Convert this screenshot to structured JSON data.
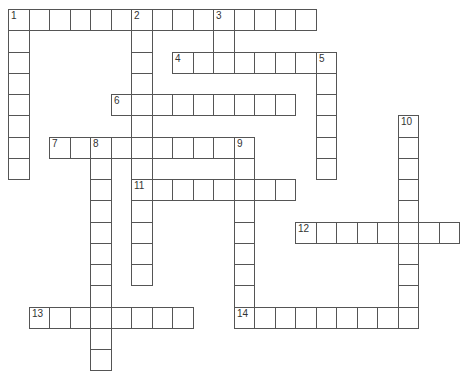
{
  "puzzle": {
    "grid": {
      "origin_x": 8,
      "origin_y": 9,
      "cell_w": 20.5,
      "cell_h": 21.25,
      "line_color": "#555555",
      "number_color": "#333333"
    },
    "entries": [
      {
        "number": "1",
        "direction": "across",
        "row": 0,
        "col": 0,
        "length": 15
      },
      {
        "number": "1",
        "direction": "down",
        "row": 0,
        "col": 0,
        "length": 8
      },
      {
        "number": "2",
        "direction": "down",
        "row": 0,
        "col": 6,
        "length": 13
      },
      {
        "number": "3",
        "direction": "down",
        "row": 0,
        "col": 10,
        "length": 3
      },
      {
        "number": "4",
        "direction": "across",
        "row": 2,
        "col": 8,
        "length": 8
      },
      {
        "number": "5",
        "direction": "down",
        "row": 2,
        "col": 15,
        "length": 6
      },
      {
        "number": "6",
        "direction": "across",
        "row": 4,
        "col": 5,
        "length": 9
      },
      {
        "number": "7",
        "direction": "across",
        "row": 6,
        "col": 2,
        "length": 10
      },
      {
        "number": "8",
        "direction": "down",
        "row": 6,
        "col": 4,
        "length": 11
      },
      {
        "number": "9",
        "direction": "down",
        "row": 6,
        "col": 11,
        "length": 9
      },
      {
        "number": "10",
        "direction": "down",
        "row": 5,
        "col": 19,
        "length": 10
      },
      {
        "number": "11",
        "direction": "across",
        "row": 8,
        "col": 6,
        "length": 8
      },
      {
        "number": "12",
        "direction": "across",
        "row": 10,
        "col": 14,
        "length": 8
      },
      {
        "number": "13",
        "direction": "across",
        "row": 14,
        "col": 1,
        "length": 8
      },
      {
        "number": "14",
        "direction": "across",
        "row": 14,
        "col": 11,
        "length": 9
      }
    ],
    "numbered_cells": [
      {
        "label": "1",
        "row": 0,
        "col": 0
      },
      {
        "label": "2",
        "row": 0,
        "col": 6
      },
      {
        "label": "3",
        "row": 0,
        "col": 10
      },
      {
        "label": "4",
        "row": 2,
        "col": 8
      },
      {
        "label": "5",
        "row": 2,
        "col": 15
      },
      {
        "label": "6",
        "row": 4,
        "col": 5
      },
      {
        "label": "7",
        "row": 6,
        "col": 2
      },
      {
        "label": "8",
        "row": 6,
        "col": 4
      },
      {
        "label": "9",
        "row": 6,
        "col": 11
      },
      {
        "label": "10",
        "row": 5,
        "col": 19
      },
      {
        "label": "11",
        "row": 8,
        "col": 6
      },
      {
        "label": "12",
        "row": 10,
        "col": 14
      },
      {
        "label": "13",
        "row": 14,
        "col": 1
      },
      {
        "label": "14",
        "row": 14,
        "col": 11
      }
    ]
  }
}
